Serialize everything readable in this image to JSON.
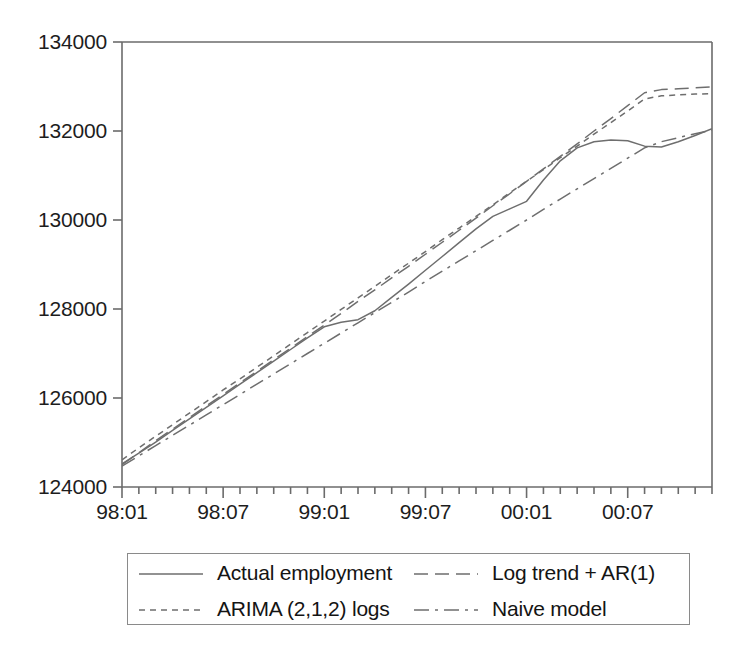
{
  "chart_data": {
    "type": "line",
    "title": "",
    "xlabel": "",
    "ylabel": "",
    "ylim": [
      124000,
      134000
    ],
    "yticks": [
      "124000",
      "126000",
      "128000",
      "130000",
      "132000",
      "134000"
    ],
    "ytick_values": [
      124000,
      126000,
      128000,
      130000,
      132000,
      134000
    ],
    "grid": false,
    "legend_position": "below-axes",
    "x": [
      "98:01",
      "98:02",
      "98:03",
      "98:04",
      "98:05",
      "98:06",
      "98:07",
      "98:08",
      "98:09",
      "98:10",
      "98:11",
      "98:12",
      "99:01",
      "99:02",
      "99:03",
      "99:04",
      "99:05",
      "99:06",
      "99:07",
      "99:08",
      "99:09",
      "99:10",
      "99:11",
      "99:12",
      "00:01",
      "00:02",
      "00:03",
      "00:04",
      "00:05",
      "00:06",
      "00:07",
      "00:08",
      "00:09",
      "00:10",
      "00:11",
      "00:12"
    ],
    "xtick_labels": [
      "98:01",
      "98:07",
      "99:01",
      "99:07",
      "00:01",
      "00:07"
    ],
    "xtick_label_indices": [
      0,
      6,
      12,
      18,
      24,
      30
    ],
    "series": [
      {
        "name": "Actual employment",
        "style": "solid",
        "values": [
          124520,
          124760,
          125010,
          125270,
          125530,
          125790,
          126050,
          126310,
          126570,
          126830,
          127090,
          127350,
          127600,
          127700,
          127760,
          127960,
          128260,
          128560,
          128870,
          129180,
          129490,
          129800,
          130080,
          130250,
          130420,
          130900,
          131330,
          131620,
          131760,
          131800,
          131780,
          131660,
          131640,
          131760,
          131900,
          132050
        ]
      },
      {
        "name": "ARIMA (2,1,2) logs",
        "style": "dashed-fine",
        "values": [
          124610,
          124880,
          125140,
          125400,
          125660,
          125920,
          126180,
          126430,
          126690,
          126950,
          127210,
          127470,
          127730,
          127990,
          128250,
          128510,
          128770,
          129030,
          129290,
          129560,
          129820,
          130080,
          130340,
          130610,
          130870,
          131130,
          131400,
          131660,
          131930,
          132190,
          132450,
          132720,
          132790,
          132810,
          132830,
          132840
        ]
      },
      {
        "name": "Log trend + AR(1)",
        "style": "dashed-long",
        "values": [
          124500,
          124770,
          125040,
          125300,
          125560,
          125820,
          126080,
          126340,
          126600,
          126860,
          127120,
          127380,
          127640,
          127900,
          128170,
          128430,
          128700,
          128960,
          129230,
          129500,
          129770,
          130040,
          130320,
          130590,
          130870,
          131150,
          131430,
          131710,
          132000,
          132280,
          132570,
          132860,
          132930,
          132950,
          132970,
          132990
        ]
      },
      {
        "name": "Naive model",
        "style": "dash-dot",
        "values": [
          124470,
          124700,
          124930,
          125160,
          125390,
          125620,
          125850,
          126080,
          126310,
          126540,
          126770,
          127000,
          127230,
          127460,
          127690,
          127920,
          128150,
          128380,
          128620,
          128850,
          129080,
          129310,
          129540,
          129770,
          130000,
          130240,
          130470,
          130700,
          130930,
          131160,
          131390,
          131620,
          131760,
          131850,
          131940,
          132020
        ]
      }
    ]
  },
  "legend": {
    "entries": [
      {
        "label": "Actual employment",
        "style": "solid"
      },
      {
        "label": "Log trend + AR(1)",
        "style": "dashed-long"
      },
      {
        "label": "ARIMA (2,1,2) logs",
        "style": "dashed-fine"
      },
      {
        "label": "Naive model",
        "style": "dash-dot"
      }
    ]
  },
  "colors": {
    "axis": "#6b6b6b",
    "line": "#6e6e6e",
    "text": "#1a1a1a",
    "background": "#ffffff",
    "legend_border": "#8a8a8a"
  }
}
